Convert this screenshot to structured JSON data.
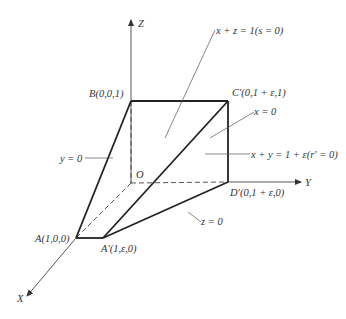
{
  "diagram": {
    "axes": {
      "x_label": "X",
      "y_label": "Y",
      "z_label": "Z",
      "origin_label": "O"
    },
    "points": {
      "A": "A(1,0,0)",
      "A_prime": "A′(1,ε,0)",
      "B": "B(0,0,1)",
      "C_prime": "C′(0,1 + ε,1)",
      "D_prime": "D′(0,1 + ε,0)"
    },
    "plane_labels": {
      "xz": "x + z = 1(s = 0)",
      "x0": "x = 0",
      "xy": "x + y = 1 + ε(r′ = 0)",
      "y0": "y = 0",
      "z0": "z = 0"
    },
    "colors": {
      "edge": "#222222",
      "axis": "#444444",
      "text": "#333333"
    }
  }
}
